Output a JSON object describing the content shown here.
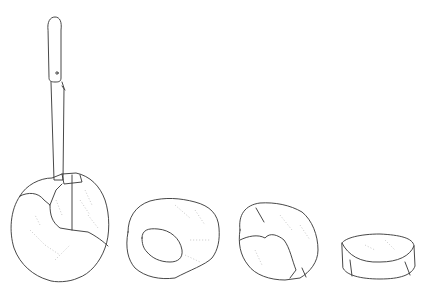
{
  "illustration": {
    "title": "",
    "background": "#ffffff",
    "line_color": "#333333",
    "vein_color": "#c4c4c4",
    "items": [
      {
        "name": "cabbage-with-knife"
      },
      {
        "name": "cabbage-half-with-core"
      },
      {
        "name": "cabbage-quarter-partially-cut"
      },
      {
        "name": "cabbage-slice"
      }
    ]
  }
}
